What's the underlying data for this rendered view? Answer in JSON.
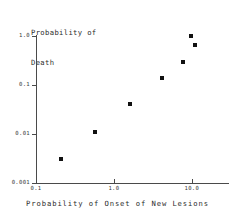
{
  "chart_data": {
    "type": "scatter",
    "title": "",
    "xlabel": "Probability of Onset of New Lesions",
    "ylabel": "Probability of\nDeath",
    "ylabel_lines": [
      "Probability of",
      "Death"
    ],
    "xscale": "log",
    "yscale": "log",
    "xlim": [
      0.1,
      30.0
    ],
    "ylim": [
      0.001,
      1.0
    ],
    "grid": false,
    "legend": null,
    "xticks": [
      {
        "value": 0.1,
        "label": "0.1"
      },
      {
        "value": 1.0,
        "label": "1.0"
      },
      {
        "value": 10.0,
        "label": "10.0"
      }
    ],
    "yticks": [
      {
        "value": 1.0,
        "label": "1.0"
      },
      {
        "value": 0.1,
        "label": "0.1"
      },
      {
        "value": 0.01,
        "label": "0.01"
      },
      {
        "value": 0.001,
        "label": "0.001"
      }
    ],
    "points": [
      {
        "x": 0.21,
        "y": 0.0031
      },
      {
        "x": 0.58,
        "y": 0.011
      },
      {
        "x": 1.6,
        "y": 0.04
      },
      {
        "x": 4.1,
        "y": 0.14
      },
      {
        "x": 7.6,
        "y": 0.29
      },
      {
        "x": 9.8,
        "y": 1.0
      },
      {
        "x": 11.0,
        "y": 0.64
      }
    ],
    "marker": "square",
    "marker_color": "#111111",
    "axis_color": "#4a4a4a"
  }
}
